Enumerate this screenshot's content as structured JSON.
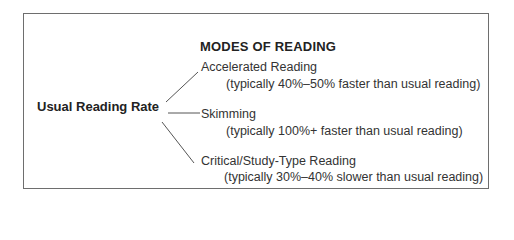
{
  "diagram": {
    "heading": "MODES OF READING",
    "root": "Usual Reading Rate",
    "modes": [
      {
        "name": "Accelerated Reading",
        "description": "(typically 40%–50% faster than usual reading)"
      },
      {
        "name": "Skimming",
        "description": "(typically 100%+ faster than usual reading)"
      },
      {
        "name": "Critical/Study-Type Reading",
        "description": "(typically 30%–40% slower than usual reading)"
      }
    ],
    "colors": {
      "border": "#6e6e6e",
      "text": "#2a2a2a",
      "lines": "#555555"
    }
  }
}
